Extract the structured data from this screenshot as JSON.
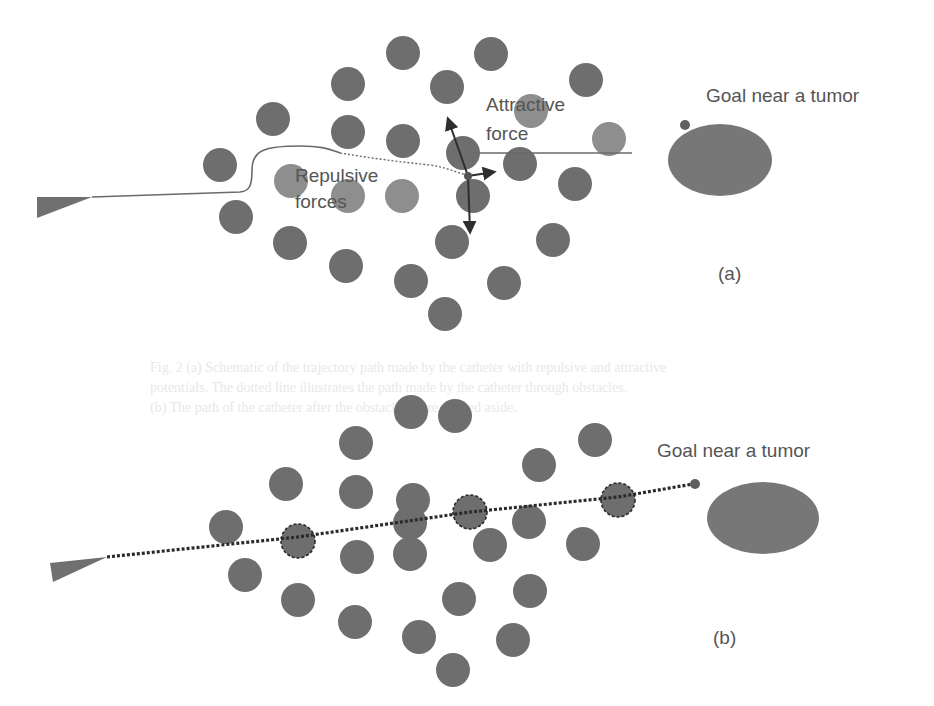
{
  "colors": {
    "obstacle": "#6e6e6e",
    "obstacle_light": "#8e8e8e",
    "tumor": "#777777",
    "goal_dot": "#606060",
    "catheter": "#707070",
    "path_solid": "#6a6a6a",
    "path_dotted": "#2a2a2a",
    "arrow": "#2e2e2e",
    "text": "#555555",
    "bleed_text": "#e6e6e6"
  },
  "panel_a": {
    "caption": "(a)",
    "goal_label": "Goal near a tumor",
    "attractive_label_line1": "Attractive",
    "attractive_label_line2": "force",
    "repulsive_label_line1": "Repulsive",
    "repulsive_label_line2": "forces",
    "catheter": {
      "points": "37,197 37,218 92,197"
    },
    "path_solid": "M92,197 L240,192 C250,191 252,185 252,170 C252,150 265,146 300,146 C325,146 330,150 340,153",
    "path_dashed": "M340,153 C370,158 400,162 430,165 C445,167 455,172 470,176",
    "attractive_line": {
      "x1": 470,
      "y1": 153,
      "x2": 632,
      "y2": 153
    },
    "force_origin": {
      "x": 468,
      "y": 176
    },
    "arrows": [
      {
        "name": "repulsive-arrow-up",
        "x2": 448,
        "y2": 119
      },
      {
        "name": "attractive-arrow-right",
        "x2": 494,
        "y2": 172
      },
      {
        "name": "repulsive-arrow-down",
        "x2": 470,
        "y2": 232
      }
    ],
    "obstacles": [
      {
        "x": 403,
        "y": 53,
        "r": 17
      },
      {
        "x": 491,
        "y": 54,
        "r": 17
      },
      {
        "x": 348,
        "y": 84,
        "r": 17
      },
      {
        "x": 447,
        "y": 87,
        "r": 17
      },
      {
        "x": 586,
        "y": 80,
        "r": 17
      },
      {
        "x": 273,
        "y": 119,
        "r": 17
      },
      {
        "x": 348,
        "y": 132,
        "r": 17
      },
      {
        "x": 403,
        "y": 141,
        "r": 17
      },
      {
        "x": 531,
        "y": 111,
        "r": 17,
        "light": true
      },
      {
        "x": 609,
        "y": 139,
        "r": 17,
        "light": true
      },
      {
        "x": 220,
        "y": 165,
        "r": 17
      },
      {
        "x": 463,
        "y": 153,
        "r": 17
      },
      {
        "x": 520,
        "y": 164,
        "r": 17
      },
      {
        "x": 291,
        "y": 181,
        "r": 17,
        "light": true
      },
      {
        "x": 348,
        "y": 196,
        "r": 17,
        "light": true
      },
      {
        "x": 402,
        "y": 196,
        "r": 17,
        "light": true
      },
      {
        "x": 473,
        "y": 196,
        "r": 17
      },
      {
        "x": 575,
        "y": 184,
        "r": 17
      },
      {
        "x": 236,
        "y": 217,
        "r": 17
      },
      {
        "x": 290,
        "y": 243,
        "r": 17
      },
      {
        "x": 452,
        "y": 242,
        "r": 17
      },
      {
        "x": 553,
        "y": 240,
        "r": 17
      },
      {
        "x": 346,
        "y": 266,
        "r": 17
      },
      {
        "x": 411,
        "y": 281,
        "r": 17
      },
      {
        "x": 504,
        "y": 283,
        "r": 17
      },
      {
        "x": 445,
        "y": 314,
        "r": 17
      }
    ],
    "goal_dot": {
      "x": 685,
      "y": 125,
      "r": 5
    },
    "tumor": {
      "cx": 720,
      "cy": 160,
      "rx": 52,
      "ry": 36
    },
    "label_positions": {
      "goal": {
        "x": 706,
        "y": 102
      },
      "attractive1": {
        "x": 486,
        "y": 111
      },
      "attractive2": {
        "x": 486,
        "y": 140
      },
      "repulsive1": {
        "x": 295,
        "y": 182
      },
      "repulsive2": {
        "x": 295,
        "y": 208
      },
      "caption": {
        "x": 718,
        "y": 280
      }
    }
  },
  "panel_b": {
    "caption": "(b)",
    "goal_label": "Goal near a tumor",
    "catheter": {
      "points": "50,563 53,582 107,557"
    },
    "path_dotted": {
      "points": "107,557 298,537 470,512 618,497 693,484"
    },
    "obstacles": [
      {
        "x": 411,
        "y": 412,
        "r": 17
      },
      {
        "x": 356,
        "y": 443,
        "r": 17
      },
      {
        "x": 455,
        "y": 416,
        "r": 17
      },
      {
        "x": 595,
        "y": 440,
        "r": 17
      },
      {
        "x": 286,
        "y": 484,
        "r": 17
      },
      {
        "x": 356,
        "y": 492,
        "r": 17
      },
      {
        "x": 413,
        "y": 500,
        "r": 17
      },
      {
        "x": 539,
        "y": 465,
        "r": 17
      },
      {
        "x": 226,
        "y": 527,
        "r": 17
      },
      {
        "x": 298,
        "y": 541,
        "r": 17,
        "ringed": true
      },
      {
        "x": 470,
        "y": 512,
        "r": 17,
        "ringed": true
      },
      {
        "x": 618,
        "y": 500,
        "r": 17,
        "ringed": true
      },
      {
        "x": 410,
        "y": 523,
        "r": 17
      },
      {
        "x": 529,
        "y": 522,
        "r": 17
      },
      {
        "x": 357,
        "y": 557,
        "r": 17
      },
      {
        "x": 410,
        "y": 554,
        "r": 17
      },
      {
        "x": 490,
        "y": 545,
        "r": 17
      },
      {
        "x": 583,
        "y": 544,
        "r": 17
      },
      {
        "x": 245,
        "y": 575,
        "r": 17
      },
      {
        "x": 298,
        "y": 600,
        "r": 17
      },
      {
        "x": 459,
        "y": 599,
        "r": 17
      },
      {
        "x": 530,
        "y": 591,
        "r": 17
      },
      {
        "x": 355,
        "y": 622,
        "r": 17
      },
      {
        "x": 419,
        "y": 637,
        "r": 17
      },
      {
        "x": 513,
        "y": 640,
        "r": 17
      },
      {
        "x": 453,
        "y": 670,
        "r": 17
      }
    ],
    "goal_dot": {
      "x": 695,
      "y": 484,
      "r": 5
    },
    "tumor": {
      "cx": 763,
      "cy": 518,
      "rx": 56,
      "ry": 36
    },
    "label_positions": {
      "goal": {
        "x": 657,
        "y": 457
      },
      "caption": {
        "x": 713,
        "y": 644
      }
    }
  },
  "bleed_through": {
    "line1": "Fig. 2  (a) Schematic of the trajectory path made by the catheter with repulsive and attractive",
    "line2": "potentials. The dotted line illustrates the path made by the catheter through obstacles.",
    "line3": "(b) The path of the catheter after the obstacles were pushed aside."
  }
}
